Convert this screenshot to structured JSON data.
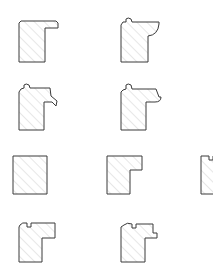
{
  "document": {
    "title": "Millwork Profile Cross-Section Chart",
    "kind": "technical-line-drawing",
    "background_color": "#ffffff",
    "outline_color": "#3a3a3a",
    "hatch_color": "#b9b9b9",
    "fill_style": "diagonal-hatch",
    "canvas": {
      "width": 213,
      "height": 269
    },
    "total_profiles": 13
  },
  "rows": [
    {
      "name": "row-1",
      "top": 14,
      "left": 16,
      "gap": 58,
      "count": 3,
      "profiles": [
        {
          "id": "profile-1-1",
          "label": "profile-1-1",
          "width": 44,
          "height": 50,
          "viewbox": "0 0 44 50",
          "path": "M3 9 L3 48 L29 48 L29 14 L42 14 L42 9 L40 7 L5 7 Z"
        },
        {
          "id": "profile-1-2",
          "label": "profile-1-2",
          "width": 44,
          "height": 50,
          "viewbox": "0 0 44 50",
          "path": "M3 11 L3 48 L30 48 L30 22 Q40 21 41 10 L41 8 L14 8 L13 5 Q10 3 8 5 L8 8 L5 8 Z"
        },
        {
          "id": "profile-1-3",
          "label": "profile-1-3",
          "width": 46,
          "height": 50,
          "viewbox": "0 0 46 50",
          "path": "M3 11 L3 48 L28 48 L28 18 L34 18 L40 13 L44 15 L43 10 L38 7 L14 7 L13 4 Q10 2 8 4 L8 7 L5 8 Z"
        }
      ]
    },
    {
      "name": "row-2",
      "top": 80,
      "left": 16,
      "gap": 58,
      "count": 3,
      "profiles": [
        {
          "id": "profile-2-1",
          "label": "profile-2-1",
          "width": 44,
          "height": 52,
          "viewbox": "0 0 44 52",
          "path": "M3 12 L3 50 L28 50 L28 22 L36 22 L40 26 L41 21 L35 16 L34 8 L14 8 L13 5 Q10 3 8 5 L8 8 L5 9 Z"
        },
        {
          "id": "profile-2-2",
          "label": "profile-2-2",
          "width": 46,
          "height": 52,
          "viewbox": "0 0 46 52",
          "path": "M3 12 L3 50 L28 50 L28 22 L37 22 Q43 22 43 17 L41 17 L38 9 L14 9 L13 5 Q10 3 8 5 L8 9 L5 10 Z"
        },
        {
          "id": "profile-2-3",
          "label": "profile-2-3",
          "width": 44,
          "height": 52,
          "viewbox": "0 0 44 52",
          "path": "M4 13 L4 50 L29 50 L29 20 Q38 20 39 12 L32 6 L11 6 L7 9 Z"
        }
      ]
    },
    {
      "name": "row-3",
      "top": 148,
      "left": 10,
      "gap": 50,
      "count": 4,
      "profiles": [
        {
          "id": "profile-3-1",
          "label": "profile-3-1",
          "width": 44,
          "height": 48,
          "viewbox": "0 0 44 48",
          "path": "M3 8 L3 46 L37 46 L37 8 Z"
        },
        {
          "id": "profile-3-2",
          "label": "profile-3-2",
          "width": 44,
          "height": 48,
          "viewbox": "0 0 44 48",
          "path": "M3 8 L3 46 L26 46 L26 22 L38 22 L38 8 Z"
        },
        {
          "id": "profile-3-3",
          "label": "profile-3-3",
          "width": 44,
          "height": 48,
          "viewbox": "0 0 44 48",
          "path": "M3 8 L3 46 L26 46 L26 22 L39 22 L39 8 L15 8 L15 12 L11 12 L11 8 Z"
        },
        {
          "id": "profile-3-4",
          "label": "profile-3-4",
          "width": 44,
          "height": 48,
          "viewbox": "0 0 44 48",
          "path": "M3 11 L3 46 L26 46 L26 22 L39 22 L39 8 L15 8 L15 12 L11 12 L11 8 Q7 7 5 9 Z"
        }
      ]
    },
    {
      "name": "row-4",
      "top": 214,
      "left": 16,
      "gap": 58,
      "count": 3,
      "profiles": [
        {
          "id": "profile-4-1",
          "label": "profile-4-1",
          "width": 44,
          "height": 50,
          "viewbox": "0 0 44 50",
          "path": "M3 13 L3 48 L26 48 L26 24 L39 24 L39 9 L15 9 L15 13 L11 13 L11 9 Q6 8 4 11 Z"
        },
        {
          "id": "profile-4-2",
          "label": "profile-4-2",
          "width": 44,
          "height": 50,
          "viewbox": "0 0 44 50",
          "path": "M3 13 L3 48 L27 48 L27 24 L39 24 L39 19 L35 19 L35 10 L18 10 L18 14 L14 14 L14 10 Q9 8 6 11 Z"
        },
        {
          "id": "profile-4-3",
          "label": "profile-4-3",
          "width": 46,
          "height": 50,
          "viewbox": "0 0 46 50",
          "path": "M3 13 L3 48 L28 48 L28 25 L40 25 L40 20 L43 17 L40 13 L36 10 L18 10 L18 14 L14 14 L14 10 Q9 8 6 11 Z"
        }
      ]
    }
  ]
}
